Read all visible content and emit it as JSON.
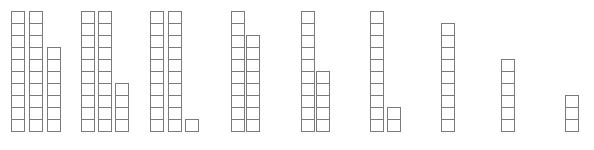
{
  "diagram": {
    "type": "base-ten-blocks",
    "line_color": "#7a7a7a",
    "background": "#ffffff",
    "cube_size": 12,
    "baseline_y": 131,
    "groups": [
      {
        "value": 27,
        "columns": [
          {
            "x": 11,
            "count": 10
          },
          {
            "x": 29,
            "count": 10
          },
          {
            "x": 47,
            "count": 7
          }
        ]
      },
      {
        "value": 24,
        "columns": [
          {
            "x": 81,
            "count": 10
          },
          {
            "x": 98,
            "count": 10
          },
          {
            "x": 115,
            "count": 4
          }
        ]
      },
      {
        "value": 21,
        "columns": [
          {
            "x": 150,
            "count": 10
          },
          {
            "x": 168,
            "count": 10
          },
          {
            "x": 185,
            "count": 1
          }
        ]
      },
      {
        "value": 18,
        "columns": [
          {
            "x": 231,
            "count": 10
          },
          {
            "x": 246,
            "count": 8
          }
        ]
      },
      {
        "value": 15,
        "columns": [
          {
            "x": 301,
            "count": 10
          },
          {
            "x": 316,
            "count": 5
          }
        ]
      },
      {
        "value": 12,
        "columns": [
          {
            "x": 370,
            "count": 10
          },
          {
            "x": 387,
            "count": 2
          }
        ]
      },
      {
        "value": 9,
        "columns": [
          {
            "x": 441,
            "count": 9
          }
        ]
      },
      {
        "value": 6,
        "columns": [
          {
            "x": 501,
            "count": 6
          }
        ]
      },
      {
        "value": 3,
        "columns": [
          {
            "x": 565,
            "count": 3
          }
        ]
      }
    ]
  }
}
